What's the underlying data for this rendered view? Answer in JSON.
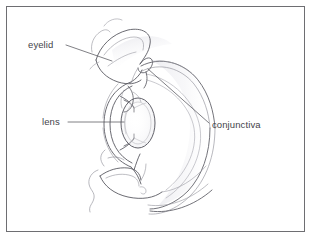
{
  "figure": {
    "style": "pencil line drawing",
    "background_color": "#ffffff",
    "frame": {
      "present": true,
      "color": "#6e6e72",
      "line_width_px": 1,
      "x": 6,
      "y": 6,
      "width": 299,
      "height": 226
    },
    "ink": {
      "line_color": "#5a5a62",
      "light_line_color": "#a9a9b0",
      "faint_shading_color": "#d8d8dd",
      "text_color": "#44444a",
      "leader_color": "#55555c"
    }
  },
  "annotations": [
    {
      "id": "eyelid",
      "label": "eyelid",
      "label_x": 28,
      "label_y": 39,
      "leader": {
        "from_x": 66,
        "from_y": 45,
        "to_x": 112,
        "to_y": 61
      },
      "points_to": "upper eyelid margin"
    },
    {
      "id": "lens",
      "label": "lens",
      "label_x": 42,
      "label_y": 116,
      "leader": {
        "from_x": 68,
        "from_y": 122,
        "to_x": 124,
        "to_y": 122
      },
      "points_to": "crystalline lens"
    },
    {
      "id": "conjunctiva",
      "label": "conjunctiva",
      "label_x": 212,
      "label_y": 119,
      "leader": {
        "from_x": 148,
        "from_y": 69,
        "to_x": 209,
        "to_y": 123
      },
      "points_to": "conjunctival fornix"
    }
  ]
}
